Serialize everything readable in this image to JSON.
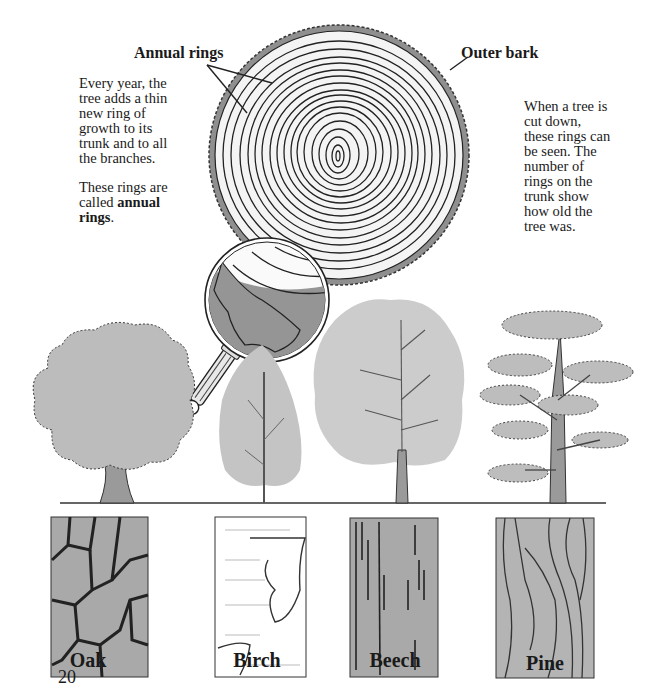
{
  "page": {
    "number": "20"
  },
  "diagram": {
    "label_annual_rings": "Annual rings",
    "label_outer_bark": "Outer bark"
  },
  "left_text": {
    "para1": "Every year, the tree adds a thin new ring of growth to its trunk and to all the branches.",
    "para2_prefix": "These rings are called ",
    "para2_bold": "annual rings",
    "para2_suffix": "."
  },
  "right_text": {
    "para1": "When a tree is cut down, these rings can be seen. The number of rings on the trunk show how old the tree was."
  },
  "trees": [
    {
      "name": "Oak",
      "bark_icon": "oak-bark-texture"
    },
    {
      "name": "Birch",
      "bark_icon": "birch-bark-texture"
    },
    {
      "name": "Beech",
      "bark_icon": "beech-bark-texture"
    },
    {
      "name": "Pine",
      "bark_icon": "pine-bark-texture"
    }
  ],
  "colors": {
    "ink": "#1a1a1a",
    "foliage": "#b8b8b8",
    "foliage_light": "#cfcfcf",
    "bark_gray": "#9a9a9a",
    "ring_fill": "#f2f2f2"
  }
}
